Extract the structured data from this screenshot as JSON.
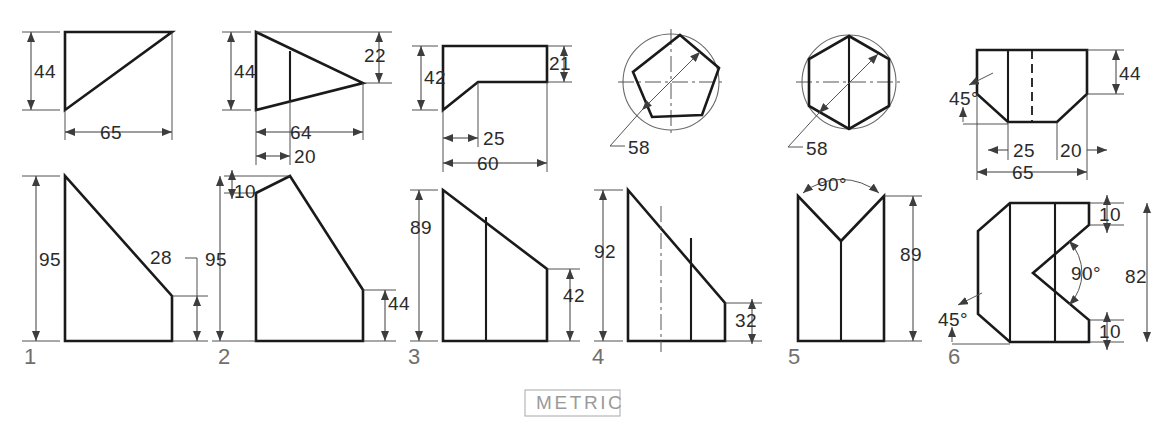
{
  "sheet": {
    "title": "METRIC",
    "units_note": "METRIC",
    "background": "#ffffff",
    "line_color": "#1a1a1a",
    "dim_color": "#3d3d3d",
    "label_color": "#6f6f6f"
  },
  "figures": [
    {
      "number": "1",
      "top_view": {
        "dims": [
          "44",
          "65"
        ]
      },
      "front_view": {
        "dims": [
          "95",
          "28"
        ]
      }
    },
    {
      "number": "2",
      "top_view": {
        "dims": [
          "44",
          "22",
          "64",
          "20"
        ]
      },
      "front_view": {
        "dims": [
          "10",
          "95",
          "44"
        ]
      }
    },
    {
      "number": "3",
      "top_view": {
        "dims": [
          "42",
          "21",
          "25",
          "60"
        ]
      },
      "front_view": {
        "dims": [
          "89",
          "42"
        ]
      }
    },
    {
      "number": "4",
      "top_view": {
        "dims": [
          "58"
        ],
        "shape": "pentagon-in-circle"
      },
      "front_view": {
        "dims": [
          "92",
          "32"
        ]
      }
    },
    {
      "number": "5",
      "top_view": {
        "dims": [
          "58"
        ],
        "shape": "hexagon-in-circle"
      },
      "front_view": {
        "dims": [
          "90°",
          "89"
        ]
      }
    },
    {
      "number": "6",
      "top_view": {
        "dims": [
          "45°",
          "44",
          "25",
          "20",
          "65"
        ]
      },
      "front_view": {
        "dims": [
          "10",
          "90°",
          "82",
          "45°",
          "10"
        ]
      }
    }
  ],
  "dimension_labels": {
    "f1_t_h": "44",
    "f1_t_w": "65",
    "f1_f_h": "95",
    "f1_f_r": "28",
    "f2_t_h": "44",
    "f2_t_r": "22",
    "f2_t_w": "64",
    "f2_t_w2": "20",
    "f2_f_t": "10",
    "f2_f_h": "95",
    "f2_f_r": "44",
    "f3_t_h": "42",
    "f3_t_r": "21",
    "f3_t_w": "25",
    "f3_t_w2": "60",
    "f3_f_h": "89",
    "f3_f_r": "42",
    "f4_t_d": "58",
    "f4_f_h": "92",
    "f4_f_r": "32",
    "f5_t_d": "58",
    "f5_f_a": "90°",
    "f5_f_h": "89",
    "f6_t_a": "45°",
    "f6_t_h": "44",
    "f6_t_w": "25",
    "f6_t_w2": "20",
    "f6_t_w3": "65",
    "f6_f_t": "10",
    "f6_f_a": "90°",
    "f6_f_h": "82",
    "f6_f_a2": "45°",
    "f6_f_b": "10"
  },
  "figure_numbers": {
    "n1": "1",
    "n2": "2",
    "n3": "3",
    "n4": "4",
    "n5": "5",
    "n6": "6"
  }
}
